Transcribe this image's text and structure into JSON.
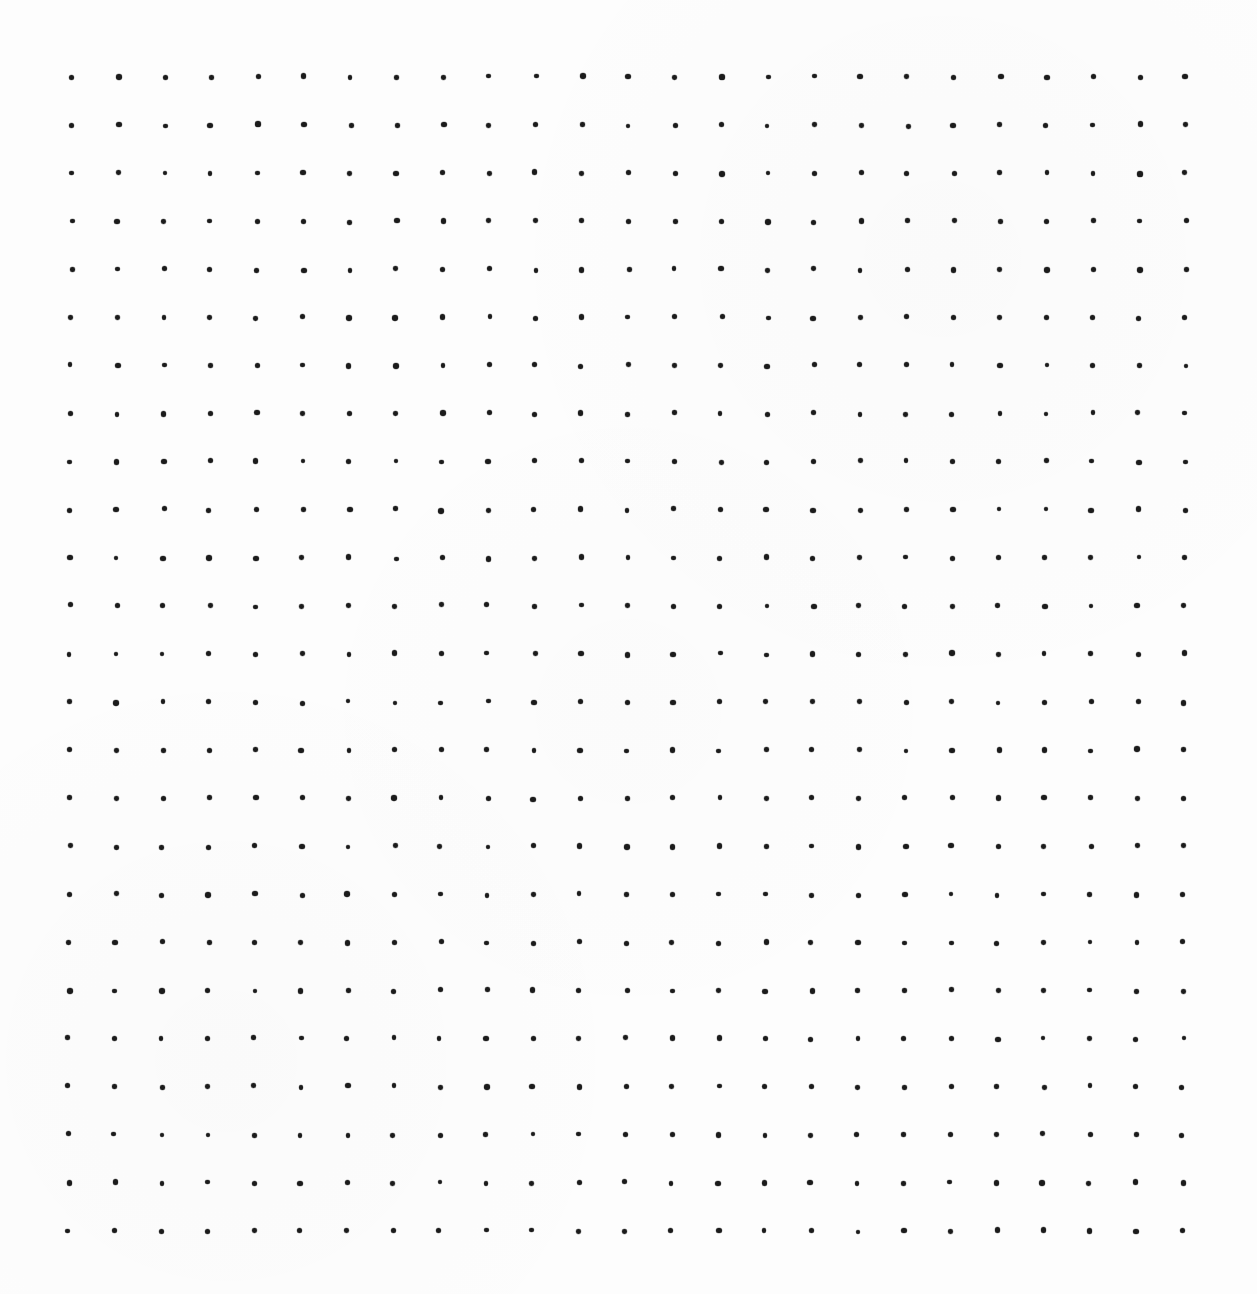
{
  "page": {
    "background_color": "#fdfdfd",
    "dot_grid": {
      "rows": 25,
      "columns": 25,
      "dot_color": "#1b1b1b",
      "dot_diameter_px": 5,
      "origin_x_px": 72,
      "origin_y_px": 77,
      "spacing_x_px": 46.42,
      "spacing_y_px": 48.08,
      "first_dot_center": [
        72,
        77
      ],
      "last_dot_center": [
        1186,
        1231
      ],
      "position_jitter_px": 1.1,
      "size_jitter_px": 1.0
    }
  }
}
